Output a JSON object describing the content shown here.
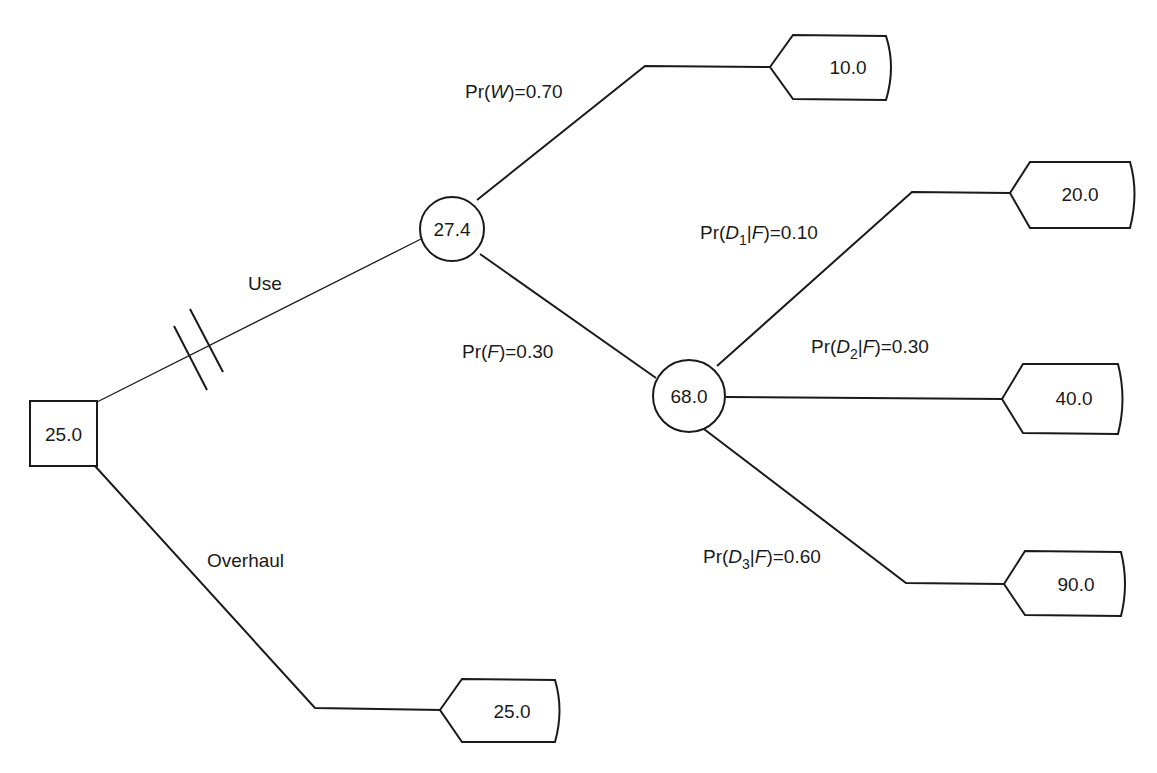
{
  "diagram": {
    "type": "decision-tree",
    "decision_node": {
      "value": "25.0"
    },
    "chance_nodes": {
      "use": {
        "value": "27.4"
      },
      "failure": {
        "value": "68.0"
      }
    },
    "branches": {
      "use": {
        "label": "Use",
        "blocked": true
      },
      "overhaul": {
        "label": "Overhaul"
      },
      "works": {
        "prefix": "Pr(",
        "var": "W",
        "suffix": ")=0.70",
        "probability": "0.70"
      },
      "fails": {
        "prefix": "Pr(",
        "var": "F",
        "suffix": ")=0.30",
        "probability": "0.30"
      },
      "d1": {
        "prefix": "Pr(",
        "var": "D",
        "sub": "1",
        "given": "|",
        "cond": "F",
        "suffix": ")=0.10",
        "probability": "0.10"
      },
      "d2": {
        "prefix": "Pr(",
        "var": "D",
        "sub": "2",
        "given": "|",
        "cond": "F",
        "suffix": ")=0.30",
        "probability": "0.30"
      },
      "d3": {
        "prefix": "Pr(",
        "var": "D",
        "sub": "3",
        "given": "|",
        "cond": "F",
        "suffix": ")=0.60",
        "probability": "0.60"
      }
    },
    "terminals": {
      "works": {
        "value": "10.0"
      },
      "d1": {
        "value": "20.0"
      },
      "d2": {
        "value": "40.0"
      },
      "d3": {
        "value": "90.0"
      },
      "overhaul": {
        "value": "25.0"
      }
    }
  }
}
